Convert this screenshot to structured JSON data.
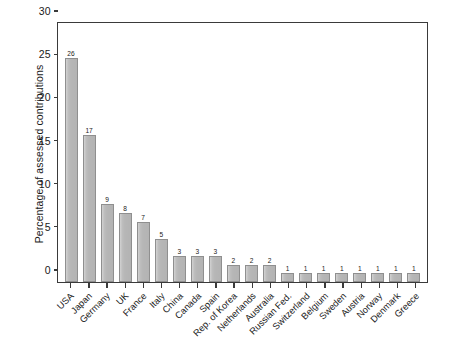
{
  "chart_data": {
    "type": "bar",
    "title": "",
    "xlabel": "",
    "ylabel": "Percentage of assessed contributions",
    "ylim": [
      0,
      30
    ],
    "yticks": [
      0,
      5,
      10,
      15,
      20,
      25,
      30
    ],
    "grid": false,
    "legend": null,
    "bar_color": "#b6b6b6",
    "bar_edge_color": "#8f8f8f",
    "axis_color": "#3a3a3a",
    "value_labels_shown": true,
    "categories": [
      "USA",
      "Japan",
      "Germany",
      "UK",
      "France",
      "Italy",
      "China",
      "Canada",
      "Spain",
      "Rep. of Korea",
      "Netherlands",
      "Australia",
      "Russian Fed.",
      "Switzerland",
      "Belgium",
      "Sweden",
      "Austria",
      "Norway",
      "Denmark",
      "Greece"
    ],
    "values": [
      26,
      17,
      9,
      8,
      7,
      5,
      3,
      3,
      3,
      2,
      2,
      2,
      1,
      1,
      1,
      1,
      1,
      1,
      1,
      1
    ],
    "value_label_text": [
      "26",
      "17",
      "9",
      "8",
      "7",
      "5",
      "3",
      "3",
      "3",
      "2",
      "2",
      "2",
      "1",
      "1",
      "1",
      "1",
      "1",
      "1",
      "1",
      "1"
    ],
    "ytick_labels": [
      "0",
      "5",
      "10",
      "15",
      "20",
      "25",
      "30"
    ]
  }
}
